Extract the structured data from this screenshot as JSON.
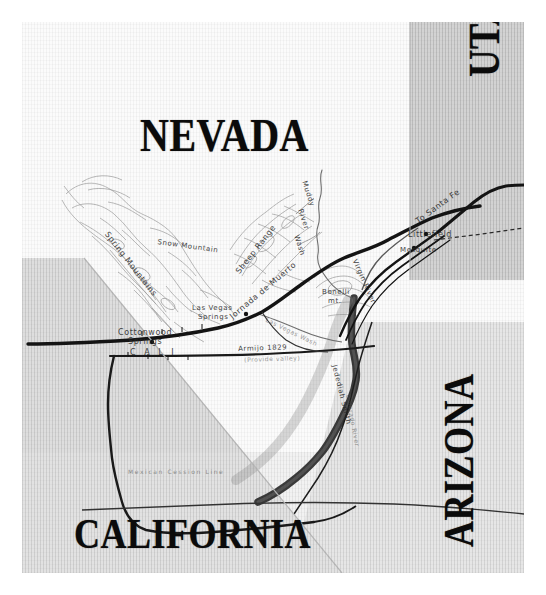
{
  "figure": {
    "kind": "historical-map-scan",
    "background_color": "#ffffff",
    "plate_color": "#fdfdfd"
  },
  "colors": {
    "ink": "#0b0b0b",
    "paper": "#fdfdfd",
    "shade_light": "#dcdcdc",
    "shade_mid": "#c9c9c9",
    "shade_dark": "#9a9a9a",
    "river_dark": "#3a3a3a",
    "hachure": "#8d8d8d"
  },
  "state_labels": [
    {
      "id": "nevada",
      "text": "NEVADA",
      "orientation": "horizontal"
    },
    {
      "id": "utah",
      "text": "UTAH",
      "orientation": "vertical-ccw"
    },
    {
      "id": "arizona",
      "text": "ARIZONA",
      "orientation": "vertical-ccw"
    },
    {
      "id": "california",
      "text": "CALIFORNIA",
      "orientation": "horizontal"
    }
  ],
  "place_labels": {
    "spring_mountains": "Spring Mountains",
    "snow_mountain": "Snow Mountain",
    "sheep_range": "Sheep Range",
    "las_vegas_springs_1": "Las Vegas",
    "las_vegas_springs_2": "Springs",
    "cottonwood_springs_1": "Cottonwood",
    "cottonwood_springs_2": "Springs",
    "bonelli_1": "Bonelli",
    "bonelli_2": "mt.",
    "littlefield": "Littlefield",
    "mesquite": "Mesquite"
  },
  "route_labels": {
    "jornada_de_muerto": "Jornada de Muerto",
    "to_santa_fe": "To Santa Fe",
    "armijo_1829": "Armijo 1829",
    "provide_valley": "(Provide valley)",
    "jedediah_smith": "Jedediah Smith",
    "cali_trail": "C A L I",
    "mexican_line": "Mexican Cession Line"
  },
  "water_labels": {
    "muddy_river_1": "Muddy",
    "muddy_river_2": "River",
    "muddy_river_3": "Wash",
    "virgin_river": "Virgin River",
    "las_vegas_wash": "Las Vegas Wash",
    "colorado_river": "Colorado River"
  }
}
